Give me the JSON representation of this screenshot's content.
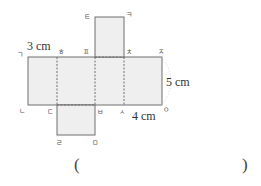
{
  "figure": {
    "type": "net-of-rectangular-prism",
    "colors": {
      "face_fill": "#efefef",
      "edge": "#6e6e6e",
      "text": "#333333"
    },
    "vertex_labels": {
      "top_left": "ㄱ",
      "top_1": "ㅎ",
      "top_2": "ㅍ",
      "top_3": "ㅊ",
      "top_right": "ㅈ",
      "flap_top_left": "ㅌ",
      "flap_top_right": "ㅋ",
      "bottom_left": "ㄴ",
      "bottom_1": "ㄷ",
      "bottom_2": "ㅂ",
      "bottom_3": "ㅅ",
      "bottom_right": "ㅇ",
      "flap_bottom_left": "ㄹ",
      "flap_bottom_right": "ㅁ"
    },
    "dimensions": {
      "width_label": "3 cm",
      "height_label": "5 cm",
      "length_label": "4 cm"
    }
  },
  "answer": {
    "open_paren": "(",
    "close_paren": ")",
    "value": ""
  }
}
